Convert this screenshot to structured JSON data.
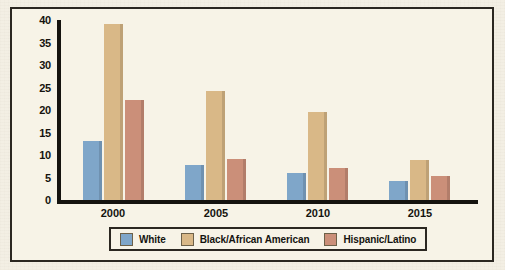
{
  "chart_data": {
    "type": "bar",
    "title": "",
    "xlabel": "",
    "ylabel": "",
    "categories": [
      "2000",
      "2005",
      "2010",
      "2015"
    ],
    "series": [
      {
        "name": "White",
        "color": "#7fa6c9",
        "values": [
          13.1,
          7.7,
          6.1,
          4.2
        ]
      },
      {
        "name": "Black/African American",
        "color": "#d9b887",
        "values": [
          39.2,
          24.3,
          19.6,
          9.0
        ]
      },
      {
        "name": "Hispanic/Latino",
        "color": "#cb8f79",
        "values": [
          22.2,
          9.1,
          7.1,
          5.3
        ]
      }
    ],
    "ylim": [
      0,
      40
    ],
    "yticks": [
      "0",
      "5",
      "10",
      "15",
      "20",
      "25",
      "30",
      "35",
      "40"
    ],
    "grid": false,
    "legend_position": "bottom"
  },
  "legend": {
    "items": [
      {
        "label": "White",
        "color": "#7fa6c9"
      },
      {
        "label": "Black/African American",
        "color": "#d9b887"
      },
      {
        "label": "Hispanic/Latino",
        "color": "#cb8f79"
      }
    ]
  },
  "colors": {
    "white_series": "#7fa6c9",
    "black_series": "#d9b887",
    "hispanic_series": "#cb8f79",
    "axis": "#15130f",
    "frame": "#2b2721",
    "background": "#f7f3e7",
    "page": "#f3efe4"
  }
}
